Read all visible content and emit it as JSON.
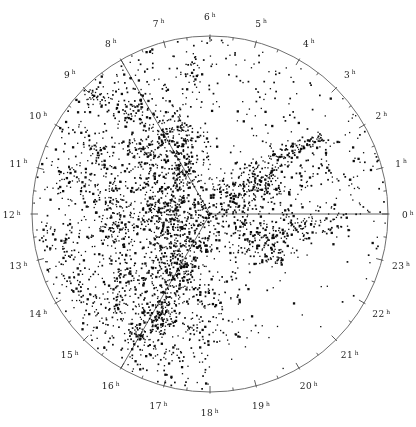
{
  "figure": {
    "background_color": "#ffffff",
    "ink_color": "#0d0d0d",
    "circle_color": "#6f6f6f",
    "tick_color": "#4a4a4a",
    "line_color": "#3d3d3d",
    "label_color": "#1c1c1c"
  },
  "chart_data": {
    "type": "scatter",
    "projection": "polar",
    "angular_unit": "right ascension (hours)",
    "angular_direction": "counterclockwise",
    "zero_hour_position": "right",
    "center_px": {
      "x": 210,
      "y": 214
    },
    "radius_px": 178,
    "angular_axis": {
      "labels": [
        "0",
        "1",
        "2",
        "3",
        "4",
        "5",
        "6",
        "7",
        "8",
        "9",
        "10",
        "11",
        "12",
        "13",
        "14",
        "15",
        "16",
        "17",
        "18",
        "19",
        "20",
        "21",
        "22",
        "23"
      ],
      "label_suffix": "h",
      "label_radius_px": 198,
      "tick_interval_hours": 0.5,
      "hour_tick_len_px": 6,
      "half_tick_len_px": 3
    },
    "radial_lines_hours": [
      0,
      8,
      16
    ],
    "point_style": {
      "color": "#0d0d0d",
      "sizes_px": [
        1.3,
        1.7,
        2.3
      ],
      "size_weights": [
        0.5,
        0.35,
        0.15
      ]
    },
    "random_seed": 1337,
    "clusters": [
      [
        175,
        133,
        13,
        15,
        120
      ],
      [
        182,
        170,
        11,
        13,
        115
      ],
      [
        178,
        203,
        12,
        15,
        140
      ],
      [
        172,
        238,
        13,
        17,
        170
      ],
      [
        177,
        268,
        11,
        12,
        110
      ],
      [
        168,
        300,
        10,
        15,
        120
      ],
      [
        152,
        322,
        12,
        11,
        110
      ],
      [
        140,
        340,
        9,
        6,
        35
      ],
      [
        148,
        150,
        14,
        11,
        100
      ],
      [
        150,
        205,
        11,
        16,
        110
      ],
      [
        110,
        190,
        11,
        20,
        100
      ],
      [
        118,
        237,
        12,
        15,
        85
      ],
      [
        131,
        278,
        12,
        13,
        70
      ],
      [
        95,
        95,
        9,
        8,
        40
      ],
      [
        130,
        112,
        11,
        8,
        55
      ],
      [
        60,
        246,
        11,
        13,
        40
      ],
      [
        82,
        287,
        11,
        11,
        38
      ],
      [
        112,
        310,
        11,
        9,
        40
      ],
      [
        100,
        150,
        8,
        8,
        35
      ],
      [
        72,
        180,
        9,
        12,
        35
      ],
      [
        262,
        182,
        15,
        12,
        190
      ],
      [
        240,
        206,
        11,
        9,
        75
      ],
      [
        283,
        158,
        6,
        5,
        30
      ],
      [
        295,
        150,
        6,
        4,
        25
      ],
      [
        306,
        144,
        6,
        4,
        22
      ],
      [
        318,
        139,
        6,
        4,
        18
      ],
      [
        250,
        236,
        20,
        11,
        120
      ],
      [
        298,
        229,
        16,
        9,
        65
      ],
      [
        326,
        221,
        11,
        7,
        35
      ],
      [
        270,
        256,
        16,
        9,
        60
      ],
      [
        310,
        175,
        13,
        9,
        30
      ],
      [
        207,
        213,
        7,
        7,
        45
      ],
      [
        204,
        241,
        9,
        11,
        55
      ],
      [
        221,
        191,
        8,
        8,
        38
      ],
      [
        192,
        68,
        6,
        8,
        22
      ],
      [
        213,
        298,
        13,
        11,
        45
      ],
      [
        230,
        330,
        18,
        12,
        30
      ],
      [
        200,
        332,
        10,
        8,
        28
      ],
      [
        172,
        356,
        10,
        6,
        22
      ]
    ],
    "background_points": {
      "candidates": 1600,
      "sector_acceptance": [
        {
          "h0": 6,
          "h1": 18,
          "p": 0.95
        },
        {
          "h0": 2,
          "h1": 6,
          "p": 0.45
        },
        {
          "h0": 0,
          "h1": 2,
          "p": 0.55
        },
        {
          "h0": 23,
          "h1": 24,
          "p": 0.55
        },
        {
          "h0": 18,
          "h1": 23,
          "p_inner": 0.4,
          "p_outer": 0.07,
          "r_split": 0.55
        }
      ]
    }
  }
}
